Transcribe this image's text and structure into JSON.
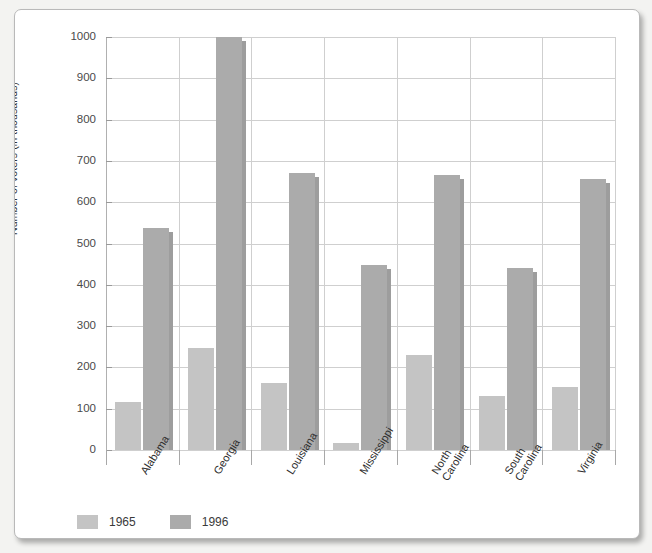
{
  "chart_data": {
    "type": "bar",
    "title": "",
    "xlabel": "",
    "ylabel": "Number of voters (in thousands)",
    "ylim": [
      0,
      1000
    ],
    "ytick_labels": [
      "1000",
      "900",
      "800",
      "700",
      "600",
      "500",
      "400",
      "300",
      "200",
      "100",
      "0"
    ],
    "ytick_values": [
      1000,
      900,
      800,
      700,
      600,
      500,
      400,
      300,
      200,
      100,
      0
    ],
    "grid": true,
    "legend_position": "below-axis-left",
    "categories": [
      "Alabama",
      "Georgia",
      "Louisiana",
      "Mississippi",
      "North\nCarolina",
      "South\nCarolina",
      "Virginia"
    ],
    "category_labels": [
      [
        "Alabama"
      ],
      [
        "Georgia"
      ],
      [
        "Louisiana"
      ],
      [
        "Mississippi"
      ],
      [
        "North",
        "Carolina"
      ],
      [
        "South",
        "Carolina"
      ],
      [
        "Virginia"
      ]
    ],
    "series": [
      {
        "name": "1965",
        "color": "#c4c4c4",
        "values": [
          117,
          247,
          162,
          17,
          230,
          130,
          152
        ]
      },
      {
        "name": "1996",
        "color": "#ababab",
        "values": [
          537,
          1000,
          670,
          447,
          667,
          440,
          655
        ]
      }
    ]
  },
  "legend": {
    "items": [
      {
        "label": "1965",
        "color": "#c4c4c4"
      },
      {
        "label": "1996",
        "color": "#ababab"
      }
    ]
  },
  "colors": {
    "series_1965": "#c4c4c4",
    "series_1996": "#ababab",
    "gridline": "#cfcfcf",
    "axis": "#9a9a9a",
    "text": "#2e2e2e",
    "page": "#ffffff"
  }
}
